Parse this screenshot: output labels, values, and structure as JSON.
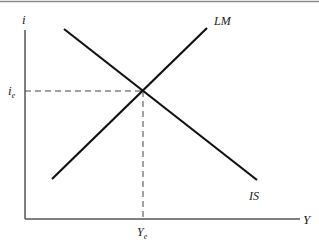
{
  "diagram": {
    "colors": {
      "line": "#111111",
      "axis": "#555555",
      "dashed": "#444444",
      "border": "#8a8a8a",
      "background": "#ffffff"
    },
    "axes": {
      "y_label": "i",
      "x_label": "Y",
      "origin": [
        25,
        219
      ],
      "y_top": 30,
      "x_right": 300
    },
    "curves": [
      {
        "name": "IS",
        "label": "IS",
        "from": [
          64,
          29
        ],
        "to": [
          257,
          180
        ],
        "label_pos": [
          257,
          200
        ]
      },
      {
        "name": "LM",
        "label": "LM",
        "from": [
          52,
          179
        ],
        "to": [
          207,
          28
        ],
        "label_pos": [
          222,
          24
        ]
      }
    ],
    "equilibrium": {
      "point": [
        143,
        91
      ],
      "i_label": "i",
      "i_sub": "e",
      "y_label": "Y",
      "y_sub": "e"
    }
  }
}
